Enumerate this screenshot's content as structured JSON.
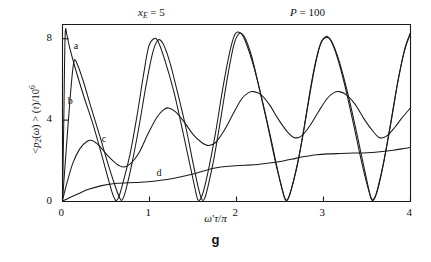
{
  "figure": {
    "caption": "g",
    "annotations": [
      {
        "name": "x_E",
        "text": "x",
        "sub": "E",
        "eq": " = 5"
      },
      {
        "name": "P",
        "text": "P",
        "sub": "",
        "eq": " = 100"
      }
    ],
    "annotation_xe_full": "x_E = 5",
    "annotation_p_full": "P = 100"
  },
  "chart_data": {
    "type": "line",
    "title": "",
    "subtitle": "",
    "xlabel": "ω'τ/π",
    "ylabel": "<p₂(ω) > (τ)/10⁶",
    "xlim": [
      0,
      4
    ],
    "ylim": [
      0,
      8.7
    ],
    "xticks": [
      0,
      1,
      2,
      3,
      4
    ],
    "yticks": [
      0,
      4,
      8
    ],
    "xtick_labels": [
      "0",
      "1",
      "2",
      "3",
      "4"
    ],
    "ytick_labels": [
      "0",
      "4",
      "8"
    ],
    "grid": false,
    "legend": "inline-curve-labels",
    "annotations": [
      {
        "label": "x_E = 5",
        "x": 0.95,
        "y": 9.4
      },
      {
        "label": "P = 100",
        "x": 2.9,
        "y": 9.4
      }
    ],
    "series": [
      {
        "name": "a",
        "label": "a",
        "label_pos": {
          "x": 0.13,
          "y": 7.6
        },
        "description": "Rabi oscillation, period 1, peak ~8.2, starts at spike near x=0",
        "points": [
          [
            0.0,
            0.05
          ],
          [
            0.015,
            4.0
          ],
          [
            0.03,
            8.15
          ],
          [
            0.05,
            8.2
          ],
          [
            0.08,
            7.6
          ],
          [
            0.15,
            6.5
          ],
          [
            0.25,
            5.1
          ],
          [
            0.35,
            3.8
          ],
          [
            0.45,
            2.3
          ],
          [
            0.52,
            1.2
          ],
          [
            0.57,
            0.45
          ],
          [
            0.6,
            0.12
          ],
          [
            0.62,
            0.05
          ],
          [
            0.65,
            0.25
          ],
          [
            0.7,
            1.0
          ],
          [
            0.78,
            2.4
          ],
          [
            0.86,
            4.3
          ],
          [
            0.93,
            6.2
          ],
          [
            0.99,
            7.6
          ],
          [
            1.05,
            8.0
          ],
          [
            1.1,
            7.85
          ],
          [
            1.18,
            6.9
          ],
          [
            1.28,
            5.4
          ],
          [
            1.38,
            3.5
          ],
          [
            1.46,
            1.9
          ],
          [
            1.52,
            0.7
          ],
          [
            1.55,
            0.15
          ],
          [
            1.58,
            0.08
          ],
          [
            1.62,
            0.5
          ],
          [
            1.68,
            1.6
          ],
          [
            1.76,
            3.4
          ],
          [
            1.84,
            5.5
          ],
          [
            1.92,
            7.3
          ],
          [
            1.98,
            8.2
          ],
          [
            2.04,
            8.3
          ],
          [
            2.1,
            7.9
          ],
          [
            2.2,
            6.6
          ],
          [
            2.3,
            4.9
          ],
          [
            2.4,
            3.0
          ],
          [
            2.48,
            1.4
          ],
          [
            2.54,
            0.35
          ],
          [
            2.57,
            0.08
          ],
          [
            2.6,
            0.2
          ],
          [
            2.66,
            1.1
          ],
          [
            2.74,
            2.7
          ],
          [
            2.82,
            4.7
          ],
          [
            2.9,
            6.6
          ],
          [
            2.97,
            7.8
          ],
          [
            3.03,
            8.05
          ],
          [
            3.09,
            7.9
          ],
          [
            3.18,
            6.9
          ],
          [
            3.28,
            5.3
          ],
          [
            3.38,
            3.4
          ],
          [
            3.46,
            1.8
          ],
          [
            3.52,
            0.6
          ],
          [
            3.55,
            0.12
          ],
          [
            3.58,
            0.1
          ],
          [
            3.63,
            0.7
          ],
          [
            3.7,
            2.1
          ],
          [
            3.78,
            4.0
          ],
          [
            3.86,
            6.0
          ],
          [
            3.94,
            7.6
          ],
          [
            4.0,
            8.3
          ]
        ]
      },
      {
        "name": "b",
        "label": "b",
        "label_pos": {
          "x": 0.06,
          "y": 4.9
        },
        "description": "Similar oscillation, phase-lagged, peak ~6.9 at x~0.13",
        "points": [
          [
            0.0,
            0.05
          ],
          [
            0.04,
            2.4
          ],
          [
            0.09,
            5.2
          ],
          [
            0.13,
            6.85
          ],
          [
            0.17,
            6.75
          ],
          [
            0.24,
            5.9
          ],
          [
            0.33,
            4.6
          ],
          [
            0.43,
            3.2
          ],
          [
            0.53,
            1.75
          ],
          [
            0.61,
            0.7
          ],
          [
            0.66,
            0.15
          ],
          [
            0.69,
            0.1
          ],
          [
            0.73,
            0.6
          ],
          [
            0.8,
            1.9
          ],
          [
            0.88,
            3.7
          ],
          [
            0.96,
            5.7
          ],
          [
            1.03,
            7.2
          ],
          [
            1.09,
            7.9
          ],
          [
            1.15,
            7.8
          ],
          [
            1.23,
            6.9
          ],
          [
            1.32,
            5.4
          ],
          [
            1.42,
            3.6
          ],
          [
            1.5,
            1.9
          ],
          [
            1.56,
            0.7
          ],
          [
            1.6,
            0.12
          ],
          [
            1.63,
            0.12
          ],
          [
            1.67,
            0.7
          ],
          [
            1.74,
            2.1
          ],
          [
            1.82,
            4.1
          ],
          [
            1.9,
            6.2
          ],
          [
            1.97,
            7.7
          ],
          [
            2.03,
            8.25
          ],
          [
            2.09,
            8.1
          ],
          [
            2.17,
            7.2
          ],
          [
            2.26,
            5.6
          ],
          [
            2.36,
            3.7
          ],
          [
            2.45,
            1.9
          ],
          [
            2.52,
            0.7
          ],
          [
            2.56,
            0.1
          ],
          [
            2.59,
            0.12
          ],
          [
            2.63,
            0.6
          ],
          [
            2.7,
            1.8
          ],
          [
            2.78,
            3.7
          ],
          [
            2.86,
            5.8
          ],
          [
            2.94,
            7.4
          ],
          [
            3.01,
            8.05
          ],
          [
            3.07,
            8.0
          ],
          [
            3.15,
            7.2
          ],
          [
            3.24,
            5.8
          ],
          [
            3.34,
            3.9
          ],
          [
            3.43,
            2.1
          ],
          [
            3.5,
            0.85
          ],
          [
            3.55,
            0.15
          ],
          [
            3.58,
            0.13
          ],
          [
            3.62,
            0.6
          ],
          [
            3.69,
            1.9
          ],
          [
            3.77,
            3.8
          ],
          [
            3.85,
            5.8
          ],
          [
            3.93,
            7.4
          ],
          [
            4.0,
            8.25
          ]
        ]
      },
      {
        "name": "c",
        "label": "c",
        "label_pos": {
          "x": 0.45,
          "y": 3.0
        },
        "description": "Damped-amplitude oscillation, slowly rising mean, period ~1",
        "points": [
          [
            0.0,
            0.05
          ],
          [
            0.05,
            0.9
          ],
          [
            0.12,
            1.9
          ],
          [
            0.2,
            2.6
          ],
          [
            0.28,
            2.95
          ],
          [
            0.34,
            3.0
          ],
          [
            0.42,
            2.75
          ],
          [
            0.52,
            2.25
          ],
          [
            0.62,
            1.85
          ],
          [
            0.7,
            1.7
          ],
          [
            0.78,
            1.85
          ],
          [
            0.88,
            2.4
          ],
          [
            0.98,
            3.3
          ],
          [
            1.08,
            4.1
          ],
          [
            1.16,
            4.5
          ],
          [
            1.22,
            4.6
          ],
          [
            1.3,
            4.4
          ],
          [
            1.4,
            3.9
          ],
          [
            1.5,
            3.3
          ],
          [
            1.6,
            2.9
          ],
          [
            1.68,
            2.75
          ],
          [
            1.76,
            2.9
          ],
          [
            1.86,
            3.5
          ],
          [
            1.96,
            4.3
          ],
          [
            2.06,
            5.05
          ],
          [
            2.14,
            5.35
          ],
          [
            2.2,
            5.4
          ],
          [
            2.28,
            5.25
          ],
          [
            2.38,
            4.75
          ],
          [
            2.48,
            4.05
          ],
          [
            2.58,
            3.45
          ],
          [
            2.66,
            3.15
          ],
          [
            2.74,
            3.2
          ],
          [
            2.84,
            3.7
          ],
          [
            2.94,
            4.4
          ],
          [
            3.04,
            5.05
          ],
          [
            3.12,
            5.35
          ],
          [
            3.18,
            5.4
          ],
          [
            3.26,
            5.25
          ],
          [
            3.36,
            4.8
          ],
          [
            3.46,
            4.1
          ],
          [
            3.56,
            3.5
          ],
          [
            3.64,
            3.15
          ],
          [
            3.72,
            3.2
          ],
          [
            3.82,
            3.65
          ],
          [
            3.9,
            4.1
          ],
          [
            4.0,
            4.6
          ]
        ]
      },
      {
        "name": "d",
        "label": "d",
        "label_pos": {
          "x": 1.08,
          "y": 1.35
        },
        "description": "Slowly increasing near-monotonic baseline with small steps",
        "points": [
          [
            0.0,
            0.02
          ],
          [
            0.08,
            0.18
          ],
          [
            0.18,
            0.38
          ],
          [
            0.3,
            0.6
          ],
          [
            0.45,
            0.78
          ],
          [
            0.6,
            0.88
          ],
          [
            0.75,
            0.92
          ],
          [
            0.9,
            0.95
          ],
          [
            1.05,
            1.0
          ],
          [
            1.2,
            1.08
          ],
          [
            1.35,
            1.2
          ],
          [
            1.5,
            1.35
          ],
          [
            1.62,
            1.5
          ],
          [
            1.72,
            1.62
          ],
          [
            1.82,
            1.7
          ],
          [
            1.95,
            1.75
          ],
          [
            2.1,
            1.78
          ],
          [
            2.25,
            1.82
          ],
          [
            2.4,
            1.9
          ],
          [
            2.55,
            2.0
          ],
          [
            2.68,
            2.12
          ],
          [
            2.8,
            2.22
          ],
          [
            2.92,
            2.3
          ],
          [
            3.05,
            2.34
          ],
          [
            3.2,
            2.36
          ],
          [
            3.35,
            2.38
          ],
          [
            3.5,
            2.4
          ],
          [
            3.65,
            2.45
          ],
          [
            3.8,
            2.52
          ],
          [
            3.92,
            2.6
          ],
          [
            4.0,
            2.66
          ]
        ]
      }
    ]
  },
  "axes": {
    "x_axis_name": "omega-prime-tau-over-pi",
    "y_axis_name": "p2-expectation-over-1e6"
  }
}
